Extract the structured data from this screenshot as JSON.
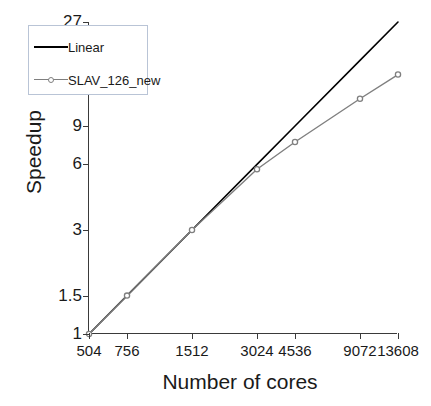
{
  "chart_data": {
    "type": "line",
    "title": "",
    "xlabel": "Number of cores",
    "ylabel": "Speedup",
    "xscale": "log",
    "yscale": "log",
    "grid": false,
    "legend_position": "upper-left-inside",
    "x": [
      504,
      756,
      1512,
      3024,
      4536,
      9072,
      13608
    ],
    "xtick_labels": [
      "504",
      "756",
      "1512",
      "3024",
      "4536",
      "9072",
      "13608"
    ],
    "ytick_values": [
      1,
      1.5,
      3,
      6,
      9,
      18,
      27
    ],
    "ytick_labels": [
      "1",
      "1.5",
      "3",
      "6",
      "9",
      "18",
      "27"
    ],
    "xlim": [
      504,
      13608
    ],
    "ylim": [
      1,
      27
    ],
    "series": [
      {
        "name": "Linear",
        "color": "#000000",
        "marker": "none",
        "values": [
          1,
          1.5,
          3,
          6,
          9,
          18,
          27
        ]
      },
      {
        "name": "SLAV_126_new",
        "color": "#7f7f7f",
        "marker": "circle",
        "values": [
          1,
          1.5,
          3,
          5.7,
          7.6,
          12.0,
          15.5
        ]
      }
    ]
  }
}
